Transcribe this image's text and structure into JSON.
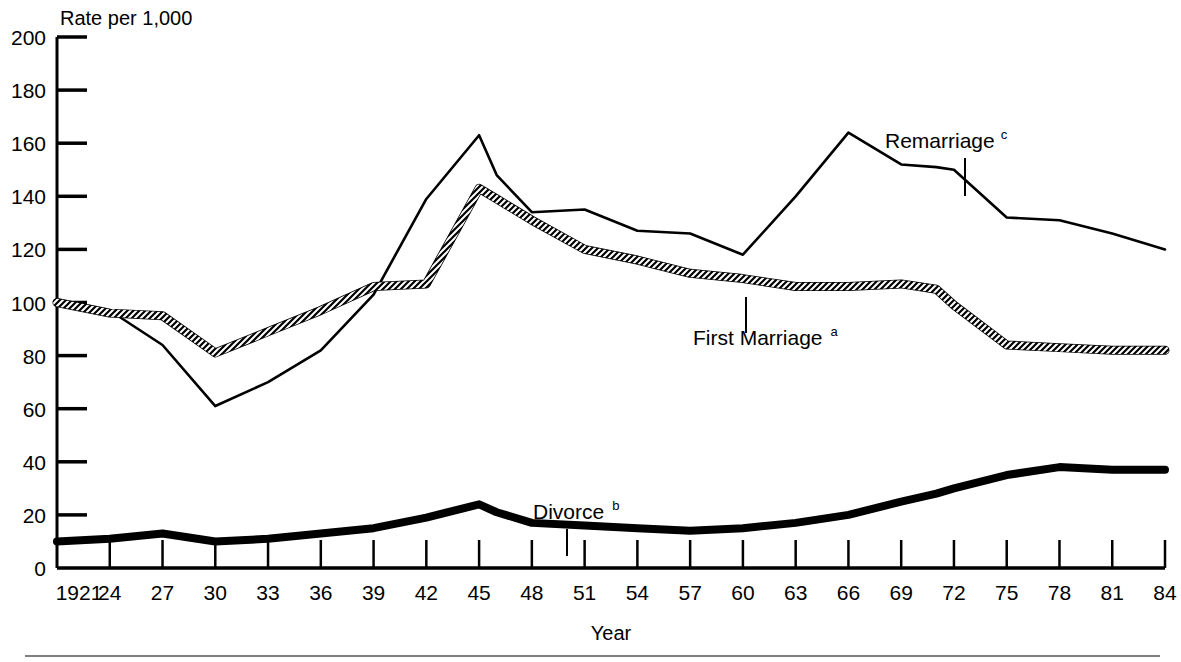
{
  "chart_data": {
    "type": "line",
    "title": "",
    "ylabel": "Rate per 1,000",
    "xlabel": "Year",
    "ylim": [
      0,
      200
    ],
    "ytick_step": 20,
    "yticks": [
      "0",
      "20",
      "40",
      "60",
      "80",
      "100",
      "120",
      "140",
      "160",
      "180",
      "200"
    ],
    "xlim": [
      1921,
      1984
    ],
    "xtick_step": 3,
    "xticks": [
      "1921",
      "24",
      "27",
      "30",
      "33",
      "36",
      "39",
      "42",
      "45",
      "48",
      "51",
      "54",
      "57",
      "60",
      "63",
      "66",
      "69",
      "72",
      "75",
      "78",
      "81",
      "84"
    ],
    "grid": false,
    "legend_position": "inline-annotations",
    "x": [
      1921,
      1924,
      1927,
      1930,
      1933,
      1936,
      1939,
      1942,
      1945,
      1946,
      1948,
      1951,
      1954,
      1957,
      1960,
      1963,
      1966,
      1969,
      1971,
      1972,
      1975,
      1978,
      1981,
      1984
    ],
    "series": [
      {
        "name": "Remarriage",
        "footnote": "c",
        "style": "thin-solid",
        "values": [
          99,
          97,
          84,
          61,
          70,
          82,
          103,
          139,
          163,
          148,
          134,
          135,
          127,
          126,
          118,
          140,
          164,
          152,
          151,
          150,
          132,
          131,
          126,
          120
        ]
      },
      {
        "name": "First Marriage",
        "footnote": "a",
        "style": "hatched",
        "values": [
          100,
          96,
          95,
          81,
          89,
          97,
          106,
          107,
          143,
          139,
          131,
          120,
          116,
          111,
          109,
          106,
          106,
          107,
          105,
          99,
          84,
          83,
          82,
          82
        ]
      },
      {
        "name": "Divorce",
        "footnote": "b",
        "style": "thick-solid",
        "values": [
          10,
          11,
          13,
          10,
          11,
          13,
          15,
          19,
          24,
          21,
          17,
          16,
          15,
          14,
          15,
          17,
          20,
          25,
          28,
          30,
          35,
          38,
          37,
          37
        ]
      }
    ],
    "annotations": [
      {
        "text": "Remarriage",
        "footnote": "c",
        "series": "Remarriage"
      },
      {
        "text": "First Marriage",
        "footnote": "a",
        "series": "First Marriage"
      },
      {
        "text": "Divorce",
        "footnote": "b",
        "series": "Divorce"
      }
    ]
  }
}
